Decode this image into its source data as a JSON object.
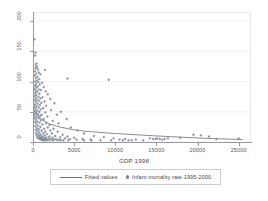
{
  "chart_data": {
    "type": "scatter",
    "title": "",
    "xlabel": "GDP 1998",
    "ylabel": "",
    "xlim": [
      0,
      26500
    ],
    "ylim": [
      0,
      215
    ],
    "xticks": [
      0,
      5000,
      10000,
      15000,
      20000,
      25000
    ],
    "yticks": [
      0,
      50,
      100,
      150,
      200
    ],
    "xtick_labels": [
      "0",
      "5000",
      "10000",
      "15000",
      "20000",
      "25000"
    ],
    "ytick_labels": [
      "0",
      "50",
      "100",
      "150",
      "200"
    ],
    "grid": true,
    "legend_position": "below",
    "series": [
      {
        "name": "Infant mortality rate 1995-2000",
        "type": "scatter",
        "marker": "diamond",
        "color": "#7b8794",
        "points": [
          [
            180,
            170
          ],
          [
            300,
            148
          ],
          [
            250,
            143
          ],
          [
            420,
            130
          ],
          [
            350,
            127
          ],
          [
            500,
            124
          ],
          [
            310,
            122
          ],
          [
            600,
            120
          ],
          [
            1450,
            119
          ],
          [
            260,
            117
          ],
          [
            700,
            115
          ],
          [
            380,
            113
          ],
          [
            900,
            112
          ],
          [
            210,
            110
          ],
          [
            550,
            108
          ],
          [
            330,
            106
          ],
          [
            4200,
            105
          ],
          [
            760,
            104
          ],
          [
            9200,
            103
          ],
          [
            480,
            102
          ],
          [
            280,
            100
          ],
          [
            640,
            99
          ],
          [
            1100,
            98
          ],
          [
            370,
            96
          ],
          [
            820,
            95
          ],
          [
            240,
            93
          ],
          [
            560,
            92
          ],
          [
            1300,
            91
          ],
          [
            430,
            90
          ],
          [
            190,
            88
          ],
          [
            700,
            87
          ],
          [
            960,
            86
          ],
          [
            320,
            85
          ],
          [
            1550,
            84
          ],
          [
            520,
            83
          ],
          [
            270,
            81
          ],
          [
            780,
            80
          ],
          [
            1800,
            79
          ],
          [
            410,
            78
          ],
          [
            220,
            76
          ],
          [
            650,
            75
          ],
          [
            1150,
            74
          ],
          [
            340,
            73
          ],
          [
            890,
            72
          ],
          [
            2100,
            71
          ],
          [
            470,
            70
          ],
          [
            200,
            69
          ],
          [
            720,
            68
          ],
          [
            1400,
            67
          ],
          [
            380,
            66
          ],
          [
            1000,
            65
          ],
          [
            2600,
            64
          ],
          [
            560,
            63
          ],
          [
            250,
            62
          ],
          [
            840,
            61
          ],
          [
            1600,
            60
          ],
          [
            430,
            59
          ],
          [
            170,
            58
          ],
          [
            690,
            57
          ],
          [
            1250,
            56
          ],
          [
            310,
            55
          ],
          [
            930,
            54
          ],
          [
            2200,
            53
          ],
          [
            500,
            52
          ],
          [
            220,
            51
          ],
          [
            760,
            50
          ],
          [
            3400,
            50
          ],
          [
            1500,
            49
          ],
          [
            390,
            48
          ],
          [
            150,
            47
          ],
          [
            620,
            46
          ],
          [
            1050,
            45
          ],
          [
            2900,
            45
          ],
          [
            280,
            44
          ],
          [
            870,
            43
          ],
          [
            1750,
            42
          ],
          [
            460,
            41
          ],
          [
            190,
            40
          ],
          [
            710,
            39
          ],
          [
            1300,
            38
          ],
          [
            4100,
            38
          ],
          [
            340,
            37
          ],
          [
            980,
            36
          ],
          [
            2400,
            35
          ],
          [
            530,
            34
          ],
          [
            230,
            33
          ],
          [
            800,
            32
          ],
          [
            1600,
            31
          ],
          [
            3100,
            31
          ],
          [
            410,
            30
          ],
          [
            1150,
            29
          ],
          [
            2000,
            28
          ],
          [
            610,
            27
          ],
          [
            270,
            26
          ],
          [
            900,
            25
          ],
          [
            1800,
            24
          ],
          [
            4600,
            24
          ],
          [
            480,
            23
          ],
          [
            1350,
            22
          ],
          [
            2500,
            22
          ],
          [
            700,
            21
          ],
          [
            320,
            20
          ],
          [
            1050,
            19
          ],
          [
            2100,
            19
          ],
          [
            5400,
            19
          ],
          [
            560,
            18
          ],
          [
            1500,
            17
          ],
          [
            3000,
            17
          ],
          [
            790,
            16
          ],
          [
            380,
            15
          ],
          [
            1250,
            15
          ],
          [
            2300,
            14
          ],
          [
            6200,
            14
          ],
          [
            640,
            13
          ],
          [
            1700,
            13
          ],
          [
            3600,
            12
          ],
          [
            950,
            12
          ],
          [
            440,
            11
          ],
          [
            1400,
            11
          ],
          [
            2700,
            10
          ],
          [
            7400,
            10
          ],
          [
            760,
            10
          ],
          [
            2000,
            9
          ],
          [
            4200,
            9
          ],
          [
            1100,
            9
          ],
          [
            530,
            8
          ],
          [
            1600,
            8
          ],
          [
            3300,
            8
          ],
          [
            8600,
            8
          ],
          [
            880,
            7
          ],
          [
            2400,
            7
          ],
          [
            5000,
            7
          ],
          [
            1300,
            7
          ],
          [
            660,
            6
          ],
          [
            1900,
            6
          ],
          [
            3900,
            6
          ],
          [
            9800,
            6
          ],
          [
            1050,
            6
          ],
          [
            2800,
            5
          ],
          [
            6000,
            5
          ],
          [
            1500,
            5
          ],
          [
            820,
            5
          ],
          [
            2200,
            5
          ],
          [
            4500,
            5
          ],
          [
            11200,
            5
          ],
          [
            1250,
            4
          ],
          [
            3200,
            4
          ],
          [
            7000,
            4
          ],
          [
            1700,
            4
          ],
          [
            980,
            4
          ],
          [
            2600,
            4
          ],
          [
            5300,
            4
          ],
          [
            12500,
            4
          ],
          [
            1450,
            4
          ],
          [
            3700,
            3
          ],
          [
            8200,
            3
          ],
          [
            2000,
            3
          ],
          [
            1150,
            3
          ],
          [
            3000,
            3
          ],
          [
            6200,
            3
          ],
          [
            13400,
            3
          ],
          [
            1650,
            3
          ],
          [
            4300,
            3
          ],
          [
            9500,
            3
          ],
          [
            2400,
            3
          ],
          [
            1350,
            3
          ],
          [
            3400,
            3
          ],
          [
            7100,
            3
          ],
          [
            14200,
            6
          ],
          [
            14600,
            5
          ],
          [
            14900,
            5
          ],
          [
            15100,
            6
          ],
          [
            15400,
            5
          ],
          [
            15700,
            4
          ],
          [
            16000,
            5
          ],
          [
            16400,
            6
          ],
          [
            17900,
            7
          ],
          [
            19500,
            12
          ],
          [
            20400,
            11
          ],
          [
            21400,
            9
          ],
          [
            22300,
            5
          ],
          [
            25000,
            6
          ],
          [
            12000,
            3
          ],
          [
            10500,
            4
          ],
          [
            10900,
            3
          ],
          [
            11600,
            3
          ]
        ]
      },
      {
        "name": "Fitted values",
        "type": "line",
        "color": "#6f6f6f",
        "points": [
          [
            150,
            52
          ],
          [
            600,
            43
          ],
          [
            1200,
            36
          ],
          [
            2000,
            30
          ],
          [
            3200,
            25
          ],
          [
            4600,
            21
          ],
          [
            6200,
            18
          ],
          [
            8000,
            16
          ],
          [
            10000,
            14
          ],
          [
            12500,
            12
          ],
          [
            15000,
            10
          ],
          [
            18000,
            8
          ],
          [
            21000,
            6
          ],
          [
            25500,
            4
          ]
        ]
      }
    ]
  },
  "legend": {
    "fitted_label": "Fitted values",
    "scatter_label": "Infant mortality rate 1995-2000"
  }
}
